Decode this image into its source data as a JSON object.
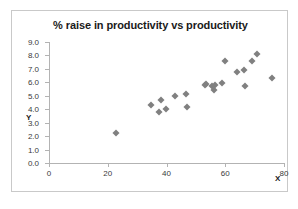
{
  "chart_data": {
    "type": "scatter",
    "title": "% raise in productivity vs productivity",
    "xlabel": "X",
    "ylabel": "Y",
    "xlim": [
      0,
      80
    ],
    "ylim": [
      0.0,
      9.0
    ],
    "xticks": [
      "0",
      "20",
      "40",
      "60",
      "80"
    ],
    "xtick_values": [
      0,
      20,
      40,
      60,
      80
    ],
    "yticks": [
      "0.0",
      "1.0",
      "2.0",
      "3.0",
      "4.0",
      "5.0",
      "6.0",
      "7.0",
      "8.0",
      "9.0"
    ],
    "ytick_values": [
      0.0,
      1.0,
      2.0,
      3.0,
      4.0,
      5.0,
      6.0,
      7.0,
      8.0,
      9.0
    ],
    "grid": false,
    "legend": false,
    "marker": "diamond",
    "marker_color": "#808080",
    "points": [
      {
        "x": 22.8,
        "y": 2.2
      },
      {
        "x": 34.6,
        "y": 4.3
      },
      {
        "x": 37.4,
        "y": 3.8
      },
      {
        "x": 38.0,
        "y": 4.7
      },
      {
        "x": 39.7,
        "y": 4.0
      },
      {
        "x": 42.8,
        "y": 5.0
      },
      {
        "x": 46.6,
        "y": 5.15
      },
      {
        "x": 46.9,
        "y": 4.2
      },
      {
        "x": 53.0,
        "y": 5.8
      },
      {
        "x": 53.6,
        "y": 5.9
      },
      {
        "x": 55.4,
        "y": 5.75
      },
      {
        "x": 56.2,
        "y": 5.45
      },
      {
        "x": 56.5,
        "y": 5.8
      },
      {
        "x": 59.0,
        "y": 5.95
      },
      {
        "x": 59.8,
        "y": 7.55
      },
      {
        "x": 64.0,
        "y": 6.8
      },
      {
        "x": 66.3,
        "y": 6.9
      },
      {
        "x": 66.6,
        "y": 5.7
      },
      {
        "x": 69.0,
        "y": 7.55
      },
      {
        "x": 70.8,
        "y": 8.1
      },
      {
        "x": 75.8,
        "y": 6.35
      }
    ]
  },
  "colors": {
    "marker": "#808080",
    "axis": "#b3b3b3",
    "frame": "#c9c9c9",
    "title_text": "#1a1a1a",
    "tick_text": "#3a3a3a",
    "background": "#ffffff"
  }
}
